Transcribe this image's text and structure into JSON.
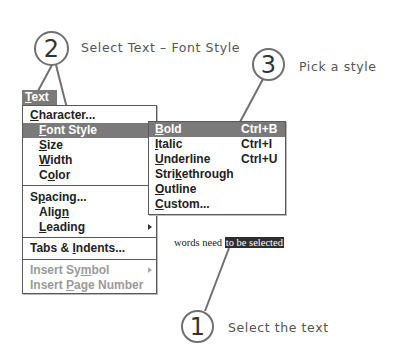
{
  "callouts": [
    {
      "number": "2",
      "text": "Select Text – Font Style"
    },
    {
      "number": "3",
      "text": "Pick a style"
    },
    {
      "number": "1",
      "text": "Select the text"
    }
  ],
  "menubar": {
    "title": "Text",
    "title_mnemonic": "T",
    "title_rest": "ext"
  },
  "main_menu": {
    "items": [
      {
        "pre": "",
        "mn": "C",
        "post": "haracter...",
        "state": "normal"
      },
      {
        "pre": "",
        "mn": "F",
        "post": "ont Style",
        "state": "highlighted"
      },
      {
        "pre": "",
        "mn": "S",
        "post": "ize",
        "state": "normal"
      },
      {
        "pre": "",
        "mn": "W",
        "post": "idth",
        "state": "normal"
      },
      {
        "pre": "C",
        "mn": "o",
        "post": "lor",
        "state": "normal"
      },
      {
        "pre": "S",
        "mn": "p",
        "post": "acing...",
        "state": "normal"
      },
      {
        "pre": "Alig",
        "mn": "n",
        "post": "",
        "state": "normal"
      },
      {
        "pre": "",
        "mn": "L",
        "post": "eading",
        "state": "normal",
        "submenu": true
      },
      {
        "pre": "Tabs & ",
        "mn": "I",
        "post": "ndents...",
        "state": "normal"
      },
      {
        "pre": "Insert Sy",
        "mn": "m",
        "post": "bol",
        "state": "disabled",
        "submenu": true
      },
      {
        "pre": "Insert ",
        "mn": "P",
        "post": "age Number",
        "state": "disabled"
      }
    ]
  },
  "sub_menu": {
    "items": [
      {
        "pre": "",
        "mn": "B",
        "post": "old",
        "shortcut": "Ctrl+B",
        "state": "highlighted"
      },
      {
        "pre": "",
        "mn": "I",
        "post": "talic",
        "shortcut": "Ctrl+I",
        "state": "normal"
      },
      {
        "pre": "",
        "mn": "U",
        "post": "nderline",
        "shortcut": "Ctrl+U",
        "state": "normal"
      },
      {
        "pre": "Stri",
        "mn": "k",
        "post": "ethrough",
        "shortcut": "",
        "state": "normal"
      },
      {
        "pre": "",
        "mn": "O",
        "post": "utline",
        "shortcut": "",
        "state": "normal"
      },
      {
        "pre": "",
        "mn": "C",
        "post": "ustom...",
        "shortcut": "",
        "state": "normal"
      }
    ]
  },
  "document": {
    "plain_text": "words need ",
    "selected_text": "to be selected"
  },
  "colors": {
    "highlight": "#7a7a7a",
    "selection": "#2e2e2e",
    "callout_line": "#707070"
  }
}
